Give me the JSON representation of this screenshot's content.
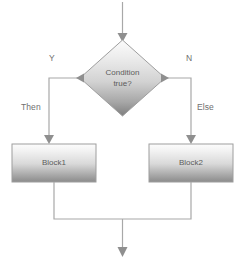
{
  "diagram": {
    "type": "flowchart",
    "title": "",
    "nodes": [
      {
        "id": "decision",
        "shape": "diamond",
        "label_line1": "Condition",
        "label_line2": "true?",
        "x": 80,
        "y": 40,
        "width": 85,
        "height": 76
      },
      {
        "id": "block1",
        "shape": "rectangle",
        "label": "Block1",
        "x": 12,
        "y": 144,
        "width": 84,
        "height": 38
      },
      {
        "id": "block2",
        "shape": "rectangle",
        "label": "Block2",
        "x": 149,
        "y": 144,
        "width": 84,
        "height": 38
      }
    ],
    "edge_labels": [
      {
        "id": "yes-branch",
        "text": "Y",
        "x": 49,
        "y": 53
      },
      {
        "id": "no-branch",
        "text": "N",
        "x": 186,
        "y": 53
      },
      {
        "id": "then-branch",
        "text": "Then",
        "x": 21,
        "y": 102
      },
      {
        "id": "else-branch",
        "text": "Else",
        "x": 197,
        "y": 102
      }
    ],
    "colors": {
      "stroke": "#a8a8a8",
      "arrow": "#8f8f8f",
      "fill_light": "#fbfbfb",
      "fill_dark": "#8d8d8d",
      "text": "#5b5b5b",
      "label_text": "#6f6f6f",
      "background": "#ffffff"
    }
  }
}
